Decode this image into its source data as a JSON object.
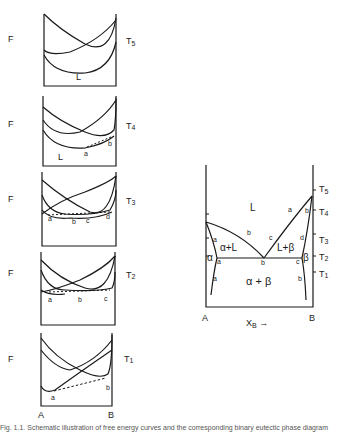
{
  "figure": {
    "free_energy_panels": [
      {
        "y_label": "F",
        "temp_label": "T5",
        "phase_label": "L",
        "points": []
      },
      {
        "y_label": "F",
        "temp_label": "T4",
        "phase_label": "L",
        "points": [
          "a",
          "b"
        ]
      },
      {
        "y_label": "F",
        "temp_label": "T3",
        "phase_label": "",
        "points": [
          "a",
          "b",
          "c",
          "d"
        ]
      },
      {
        "y_label": "F",
        "temp_label": "T2",
        "phase_label": "",
        "points": [
          "a",
          "b",
          "c"
        ]
      },
      {
        "y_label": "F",
        "temp_label": "T1",
        "phase_label": "",
        "points": [
          "a",
          "b"
        ]
      }
    ],
    "left_axis": {
      "left": "A",
      "right": "B"
    },
    "phase_diagram": {
      "temps": [
        "T5",
        "T4",
        "T3",
        "T2",
        "T1"
      ],
      "x_left": "A",
      "x_right": "B",
      "x_label": "XB",
      "x_arrow": "→",
      "regions": {
        "liquid": "L",
        "alpha_liquid": "α+L",
        "liquid_beta": "L+β",
        "alpha": "α",
        "beta": "β",
        "alpha_beta": "α + β"
      },
      "point_labels": {
        "T4": [
          "a",
          "b"
        ],
        "T3": [
          "a",
          "b",
          "c",
          "d"
        ],
        "T2": [
          "a",
          "b",
          "c"
        ],
        "T1": [
          "a",
          "b"
        ]
      }
    },
    "caption": "Fig. 1.1.  Schematic illustration of free energy curves and the corresponding binary eutectic phase diagram"
  }
}
